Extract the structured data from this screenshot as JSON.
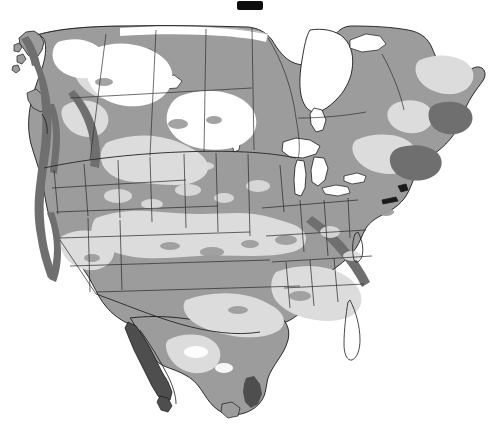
{
  "figure": {
    "title": "Grayscale thematic map of North America",
    "projection_note": "continental outline with state and province boundaries",
    "background_color": "#ffffff",
    "width": 504,
    "height": 447,
    "top_artifact_label": "black bar artifact",
    "top_artifact_color": "#0d0d0d",
    "caption": ""
  },
  "palette": {
    "background": "#ffffff",
    "water": "#ffffff",
    "class_1": "#ffffff",
    "class_2": "#dcdcdc",
    "class_3": "#9c9c9c",
    "class_4": "#6f6f6f",
    "class_5": "#4e4e4e",
    "outline": "#1a1a1a",
    "boundary": "#2b2b2b"
  },
  "legend_classes": [
    {
      "id": "class_1",
      "label": "Lightest tone",
      "color": "#ffffff"
    },
    {
      "id": "class_2",
      "label": "Light gray tone",
      "color": "#dcdcdc"
    },
    {
      "id": "class_3",
      "label": "Medium gray tone",
      "color": "#9c9c9c"
    },
    {
      "id": "class_4",
      "label": "Dark gray tone",
      "color": "#6f6f6f"
    },
    {
      "id": "class_5",
      "label": "Darkest gray tone",
      "color": "#4e4e4e"
    }
  ],
  "map_regions": [
    {
      "name": "canada-landmass",
      "tone": "class_3"
    },
    {
      "name": "hudson-bay",
      "tone": "water"
    },
    {
      "name": "great-lakes",
      "tone": "water"
    },
    {
      "name": "great-plains",
      "tone": "class_2"
    },
    {
      "name": "rocky-mountains",
      "tone": "class_3"
    },
    {
      "name": "pacific-coast-range",
      "tone": "class_4"
    },
    {
      "name": "great-basin",
      "tone": "class_2"
    },
    {
      "name": "southeast-coastal-plain",
      "tone": "class_2"
    },
    {
      "name": "appalachians",
      "tone": "class_3"
    },
    {
      "name": "florida-peninsula",
      "tone": "class_3"
    },
    {
      "name": "mexican-plateau",
      "tone": "class_3"
    },
    {
      "name": "baja-california",
      "tone": "class_5"
    },
    {
      "name": "sierra-madre-oriental",
      "tone": "class_5"
    },
    {
      "name": "alaska-panhandle",
      "tone": "class_4"
    }
  ],
  "boundaries": {
    "country_count": 3,
    "shows_state_lines": "yes",
    "shows_province_lines": "yes"
  }
}
